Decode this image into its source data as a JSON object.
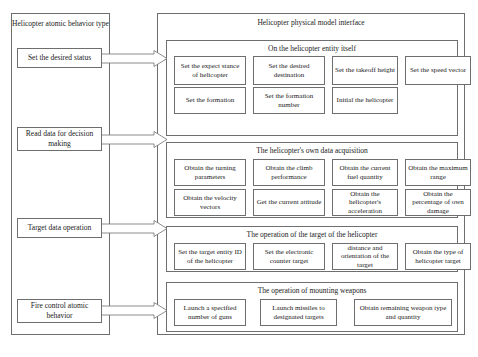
{
  "left_panel": {
    "title": "Helicopter atomic behavior type",
    "items": [
      {
        "label": "Set the desired status",
        "top": 48,
        "height": 20
      },
      {
        "label": "Read data for decision making",
        "top": 127,
        "height": 24
      },
      {
        "top": 218,
        "label": "Target data operation",
        "height": 20
      },
      {
        "label": "Fire control atomic behavior",
        "top": 299,
        "height": 24
      }
    ]
  },
  "arrows": [
    {
      "name": "arrow-set-desired-status",
      "top": 50
    },
    {
      "name": "arrow-read-data",
      "top": 131
    },
    {
      "name": "arrow-target-data",
      "top": 220
    },
    {
      "name": "arrow-fire-control",
      "top": 302
    }
  ],
  "right_panel": {
    "title": "Helicopter physical model interface",
    "groups": [
      {
        "title": "On the helicopter entity itself",
        "top": 26,
        "height": 96,
        "rows": [
          [
            {
              "label": "Set the expect stance of helicopter",
              "left": 7,
              "width": 72
            },
            {
              "label": "Set the desired destination",
              "left": 86,
              "width": 72
            },
            {
              "label": "Set the takeoff height",
              "left": 165,
              "width": 66
            },
            {
              "label": "Set the speed vector",
              "left": 238,
              "width": 66
            }
          ],
          [
            {
              "label": "Set the formation",
              "left": 7,
              "width": 72
            },
            {
              "label": "Set the formation number",
              "left": 86,
              "width": 72
            },
            {
              "label": "Initial the helicopter",
              "left": 165,
              "width": 66
            }
          ]
        ]
      },
      {
        "title": "The helicopter's own data acquisition",
        "top": 128,
        "height": 76,
        "rows": [
          [
            {
              "label": "Obtain the turning parameters",
              "left": 7,
              "width": 72
            },
            {
              "label": "Obtain the climb performance",
              "left": 86,
              "width": 72
            },
            {
              "label": "Obtain the current fuel quantity",
              "left": 165,
              "width": 66
            },
            {
              "label": "Obtain the maximum range",
              "left": 238,
              "width": 66
            }
          ],
          [
            {
              "label": "Obtain the velocity vectors",
              "left": 7,
              "width": 72
            },
            {
              "label": "Get the current attitude",
              "left": 86,
              "width": 72
            },
            {
              "label": "Obtain the helicopter's acceleration",
              "left": 165,
              "width": 66
            },
            {
              "label": "Obtain the percentage of own damage",
              "left": 238,
              "width": 66
            }
          ]
        ]
      },
      {
        "title": "The operation of the target of the helicopter",
        "top": 212,
        "height": 46,
        "rows": [
          [
            {
              "label": "Set the target entity ID of the helicopter",
              "left": 7,
              "width": 72
            },
            {
              "label": "Set the electronic counter target",
              "left": 86,
              "width": 72
            },
            {
              "label": "distance and orientation of the target",
              "left": 165,
              "width": 66
            },
            {
              "label": "Obtain the type of helicopter target",
              "left": 238,
              "width": 66
            }
          ]
        ]
      },
      {
        "title": "The operation of mounting weapons",
        "top": 268,
        "height": 50,
        "rows": [
          [
            {
              "label": "Launch a specified number of guns",
              "left": 7,
              "width": 72
            },
            {
              "label": "Launch missiles to designated targets",
              "left": 93,
              "width": 77
            },
            {
              "label": "Obtain remaining weapon type and quantity",
              "left": 187,
              "width": 98
            }
          ]
        ]
      }
    ]
  },
  "colors": {
    "line": "#6e6e6e",
    "text": "#1a1a1a",
    "background": "#ffffff"
  }
}
